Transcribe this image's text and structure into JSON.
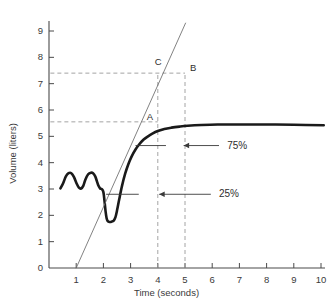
{
  "chart_data": {
    "type": "line",
    "title": "",
    "xlabel": "Time (seconds)",
    "ylabel": "Volume (liters)",
    "xlim": [
      0,
      10.4
    ],
    "ylim": [
      0,
      9.6
    ],
    "grid": false,
    "legend": "none",
    "x_ticks": [
      1,
      2,
      3,
      4,
      5,
      6,
      7,
      8,
      9,
      10
    ],
    "x_tick_labels": [
      "1",
      "2",
      "3",
      "4",
      "5",
      "6",
      "7",
      "8",
      "9",
      "10"
    ],
    "y_ticks": [
      0,
      1,
      2,
      3,
      4,
      5,
      6,
      7,
      8,
      9
    ],
    "y_tick_labels": [
      "0",
      "1",
      "2",
      "3",
      "4",
      "5",
      "6",
      "7",
      "8",
      "9"
    ],
    "series": [
      {
        "name": "volume-trace",
        "style": "thick-solid",
        "color": "#1a1a1a",
        "points": [
          [
            0.42,
            3.02
          ],
          [
            0.52,
            3.22
          ],
          [
            0.62,
            3.48
          ],
          [
            0.72,
            3.6
          ],
          [
            0.82,
            3.6
          ],
          [
            0.92,
            3.45
          ],
          [
            1.02,
            3.2
          ],
          [
            1.1,
            3.05
          ],
          [
            1.18,
            3.02
          ],
          [
            1.26,
            3.12
          ],
          [
            1.34,
            3.36
          ],
          [
            1.44,
            3.56
          ],
          [
            1.54,
            3.62
          ],
          [
            1.62,
            3.6
          ],
          [
            1.7,
            3.48
          ],
          [
            1.76,
            3.3
          ],
          [
            1.82,
            3.12
          ],
          [
            1.88,
            3.02
          ],
          [
            1.94,
            3.0
          ],
          [
            2.0,
            2.88
          ],
          [
            2.04,
            2.55
          ],
          [
            2.08,
            2.15
          ],
          [
            2.12,
            1.88
          ],
          [
            2.16,
            1.78
          ],
          [
            2.22,
            1.75
          ],
          [
            2.3,
            1.76
          ],
          [
            2.38,
            1.8
          ],
          [
            2.44,
            1.92
          ],
          [
            2.5,
            2.18
          ],
          [
            2.58,
            2.6
          ],
          [
            2.68,
            3.1
          ],
          [
            2.8,
            3.58
          ],
          [
            2.92,
            3.95
          ],
          [
            3.04,
            4.24
          ],
          [
            3.18,
            4.5
          ],
          [
            3.32,
            4.7
          ],
          [
            3.48,
            4.88
          ],
          [
            3.64,
            5.0
          ],
          [
            3.8,
            5.1
          ],
          [
            4.0,
            5.2
          ],
          [
            4.24,
            5.28
          ],
          [
            4.5,
            5.33
          ],
          [
            4.8,
            5.37
          ],
          [
            5.1,
            5.4
          ],
          [
            5.6,
            5.43
          ],
          [
            6.2,
            5.45
          ],
          [
            7.0,
            5.45
          ],
          [
            8.0,
            5.45
          ],
          [
            9.0,
            5.44
          ],
          [
            10.1,
            5.42
          ]
        ]
      },
      {
        "name": "extrapolation-line",
        "style": "thin-solid",
        "color": "#6b6b6b",
        "points": [
          [
            1.0,
            0.0
          ],
          [
            5.02,
            9.3
          ]
        ]
      }
    ],
    "reference_lines": [
      {
        "name": "horizontal-dashed-upper",
        "orientation": "horizontal",
        "value": 7.4,
        "x_from": 0.05,
        "x_to": 5.0
      },
      {
        "name": "horizontal-dashed-lower",
        "orientation": "horizontal",
        "value": 5.55,
        "x_from": 0.05,
        "x_to": 4.0
      },
      {
        "name": "vertical-dashed-t4",
        "orientation": "vertical",
        "value": 4.0,
        "y_from": 0.0,
        "y_to": 7.4
      },
      {
        "name": "vertical-dashed-t5",
        "orientation": "vertical",
        "value": 5.0,
        "y_from": 0.0,
        "y_to": 7.4
      }
    ],
    "level_markers": [
      {
        "name": "marker-75-percent",
        "value": 4.65,
        "x_from": 3.18,
        "x_to": 4.3
      },
      {
        "name": "marker-25-percent",
        "value": 2.8,
        "x_from": 2.1,
        "x_to": 3.3
      }
    ],
    "point_labels": [
      {
        "name": "label-A",
        "text": "A",
        "x": 4.0,
        "y": 5.55
      },
      {
        "name": "label-B",
        "text": "B",
        "x": 5.0,
        "y": 7.4
      },
      {
        "name": "label-C",
        "text": "C",
        "x": 4.0,
        "y": 7.4
      }
    ],
    "annotations": [
      {
        "name": "annotation-75-percent",
        "text": "75%",
        "x": 6.55,
        "y": 4.65,
        "arrow_from_x": 6.25,
        "arrow_to_x": 4.95,
        "arrow_direction": "left"
      },
      {
        "name": "annotation-25-percent",
        "text": "25%",
        "x": 6.25,
        "y": 2.8,
        "arrow_from_x": 5.95,
        "arrow_to_x": 4.05,
        "arrow_direction": "left"
      }
    ]
  }
}
